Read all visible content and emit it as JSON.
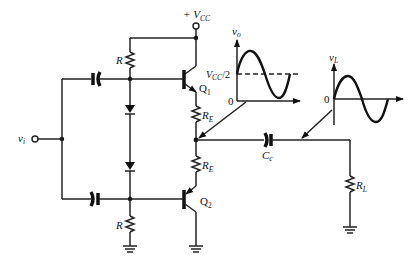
{
  "diagram": {
    "supply": {
      "label": "+ V",
      "sub": "CC"
    },
    "input": {
      "label": "v",
      "sub": "i"
    },
    "transistors": [
      {
        "id": "Q1",
        "label": "Q",
        "sub": "1",
        "type": "NPN"
      },
      {
        "id": "Q2",
        "label": "Q",
        "sub": "2",
        "type": "PNP"
      }
    ],
    "resistors": [
      {
        "id": "R_top",
        "label": "R"
      },
      {
        "id": "R_bottom",
        "label": "R"
      },
      {
        "id": "RE_top",
        "label": "R",
        "sub": "E"
      },
      {
        "id": "RE_bottom",
        "label": "R",
        "sub": "E"
      },
      {
        "id": "RL",
        "label": "R",
        "sub": "L"
      }
    ],
    "capacitors": [
      {
        "id": "C_in_top",
        "label": ""
      },
      {
        "id": "C_in_bottom",
        "label": ""
      },
      {
        "id": "Cc",
        "label": "C",
        "sub": "c"
      }
    ],
    "diodes": [
      {
        "id": "D1"
      },
      {
        "id": "D2"
      }
    ],
    "waveforms": {
      "vo": {
        "label": "v",
        "sub": "o",
        "zero_label": "0",
        "offset_label": "V",
        "offset_sub": "CC",
        "offset_suffix": "/2"
      },
      "vL": {
        "label": "v",
        "sub": "L",
        "zero_label": "0"
      }
    }
  }
}
